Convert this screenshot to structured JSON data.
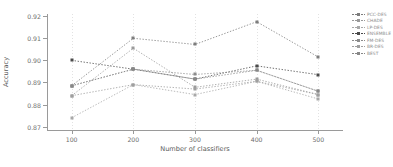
{
  "chart_data": {
    "type": "line",
    "title": "",
    "xlabel": "Number of classifiers",
    "ylabel": "Accuracy",
    "x": [
      100,
      200,
      300,
      400,
      500
    ],
    "xticklabels": [
      "100",
      "200",
      "300",
      "400",
      "500"
    ],
    "yticklabels": [
      "0.92",
      "0.91",
      "0.90",
      "0.89",
      "0.88",
      "0.87"
    ],
    "yticks": [
      0.92,
      0.91,
      0.9,
      0.89,
      0.88,
      0.87
    ],
    "ylim": [
      0.868,
      0.921
    ],
    "xlim": [
      60,
      540
    ],
    "grid": "vertical-dotted",
    "legend_position": "upper-right",
    "linestyle": "dotted",
    "marker": "square",
    "series": [
      {
        "name": "PCC-DES",
        "color": "#7d7d7d",
        "values": [
          0.8885,
          0.91,
          0.9072,
          0.9175,
          0.9015
        ]
      },
      {
        "name": "CHADE",
        "color": "#9a9a9a",
        "values": [
          0.884,
          0.9055,
          0.8878,
          0.8915,
          0.8845
        ]
      },
      {
        "name": "LP-DES",
        "color": "#a8a8a8",
        "values": [
          0.874,
          0.889,
          0.8845,
          0.8905,
          0.8825
        ]
      },
      {
        "name": "ENSEMBLE",
        "color": "#4a4a4a",
        "values": [
          0.9,
          0.896,
          0.8915,
          0.8975,
          0.8935
        ]
      },
      {
        "name": "FM-DES",
        "color": "#8c8c8c",
        "values": [
          0.8885,
          0.896,
          0.8936,
          0.8955,
          0.886
        ]
      },
      {
        "name": "BR-DES",
        "color": "#9f9f9f",
        "values": [
          0.884,
          0.889,
          0.887,
          0.8905,
          0.8845
        ]
      },
      {
        "name": "BEST",
        "color": "#888888",
        "values": [
          0.8885,
          0.896,
          0.8915,
          0.8955,
          0.886
        ]
      }
    ]
  }
}
